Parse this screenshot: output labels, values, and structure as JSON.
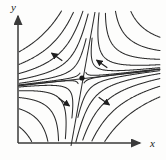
{
  "figure": {
    "background_color": "#fdfdfc",
    "stroke_color": "#2b2b2b",
    "axis_color": "#3a3a3a"
  },
  "axes": {
    "x_label": "x",
    "y_label": "y",
    "origin": {
      "x": 18,
      "y": 143
    },
    "x_axis_end": {
      "x": 144,
      "y": 143
    },
    "y_axis_end": {
      "x": 18,
      "y": 12
    },
    "x_label_pos": {
      "x": 152,
      "y": 147
    },
    "y_label_pos": {
      "x": 14,
      "y": 10
    },
    "arrowheads": [
      "x-axis-arrowhead",
      "y-axis-arrowhead"
    ]
  },
  "equilibrium": {
    "name": "saddle-point",
    "x": 82,
    "y": 78,
    "radius": 2.6,
    "color": "#1a1a1a"
  },
  "chart_data": {
    "type": "line",
    "xlabel": "x",
    "ylabel": "y",
    "grid": false,
    "legend": false,
    "separatrices": [
      {
        "name": "stable-separatrix",
        "x1": 18,
        "y1": 86,
        "x2": 150,
        "y2": 71
      },
      {
        "name": "unstable-separatrix",
        "x1": 95,
        "y1": 12,
        "x2": 71,
        "y2": 146
      }
    ],
    "trajectory_count": 20,
    "trajectory_offsets": [
      4,
      11,
      19,
      28,
      38,
      49
    ],
    "arrow_flow": [
      {
        "quadrant": "upper-left",
        "x": 57,
        "y": 57,
        "angle_deg": 215,
        "direction": "up-left"
      },
      {
        "quadrant": "upper-right",
        "x": 102,
        "y": 64,
        "angle_deg": 215,
        "direction": "down-left"
      },
      {
        "quadrant": "lower-left",
        "x": 64,
        "y": 102,
        "angle_deg": 35,
        "direction": "up-right"
      },
      {
        "quadrant": "lower-right",
        "x": 104,
        "y": 101,
        "angle_deg": 35,
        "direction": "down-right"
      }
    ]
  }
}
